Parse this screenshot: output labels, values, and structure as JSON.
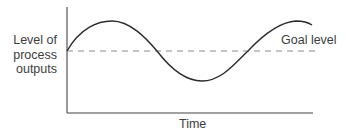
{
  "diagram": {
    "type": "process-output-over-time",
    "y_axis_label": [
      "Level of",
      "process",
      "outputs"
    ],
    "x_axis_label": "Time",
    "goal_line_label": "Goal level",
    "colors": {
      "curve": "#2b2b2b",
      "axes": "#444444",
      "goal_line": "#8a8a8a",
      "text": "#3d3d3d"
    },
    "curve_description": "sinusoidal oscillation around goal level: starts at goal, rises to peak, falls below goal to trough, rises above goal again"
  }
}
